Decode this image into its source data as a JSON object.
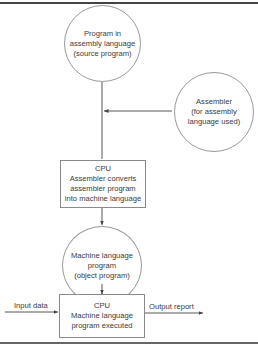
{
  "diagram": {
    "type": "flowchart",
    "nodes": [
      {
        "id": "source",
        "shape": "circle",
        "text": "Program in\nassembly language\n(source program)"
      },
      {
        "id": "assembler",
        "shape": "circle",
        "text": "Assembler\n(for assembly\nlanguage used)"
      },
      {
        "id": "cpu1",
        "shape": "rectangle",
        "title": "CPU",
        "text": "Assembler converts\nassembler program\ninto machine language"
      },
      {
        "id": "object",
        "shape": "circle",
        "text": "Machine language\nprogram\n(object program)"
      },
      {
        "id": "cpu2",
        "shape": "rectangle",
        "title": "CPU",
        "text": "Machine language\nprogram executed"
      }
    ],
    "edges": [
      {
        "from": "source",
        "to": "cpu1"
      },
      {
        "from": "assembler",
        "to": "cpu1"
      },
      {
        "from": "cpu1",
        "to": "object"
      },
      {
        "from": "object",
        "to": "cpu2"
      },
      {
        "from": "input",
        "to": "cpu2",
        "label": "Input data"
      },
      {
        "from": "cpu2",
        "to": "output",
        "label": "Output report"
      }
    ]
  },
  "labels": {
    "input": "Input data",
    "output": "Output report"
  },
  "colors": {
    "line": "#444444",
    "shape_border": "#9a9a9a",
    "text": "#3a3a3a"
  }
}
